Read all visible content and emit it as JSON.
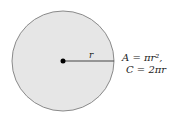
{
  "diagram": {
    "circle": {
      "fill": "#e6e6e6",
      "stroke": "#8a8a8a"
    },
    "radius_label": "r",
    "formulas": {
      "area": "A = πr²,",
      "circumference": "C = 2πr"
    }
  }
}
